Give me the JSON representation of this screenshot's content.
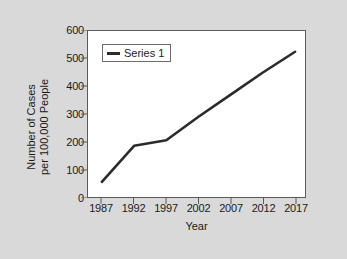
{
  "chart_data": {
    "type": "line",
    "title": "",
    "xlabel": "Year",
    "ylabel": "Number of Cases per 100,000 People",
    "ylabel_lines": [
      "Number of Cases",
      "per 100,000 People"
    ],
    "categories": [
      "1987",
      "1992",
      "1997",
      "2002",
      "2007",
      "2012",
      "2017"
    ],
    "x": [
      1987,
      1992,
      1997,
      2002,
      2007,
      2012,
      2017
    ],
    "series": [
      {
        "name": "Series 1",
        "color": "#2b2b2b",
        "values": [
          55,
          185,
          205,
          290,
          370,
          450,
          525
        ]
      }
    ],
    "ylim": [
      0,
      600
    ],
    "xlim": [
      1987,
      2017
    ],
    "y_ticks": [
      0,
      100,
      200,
      300,
      400,
      500,
      600
    ],
    "y_tick_labels": [
      "0",
      "100",
      "200",
      "300",
      "400",
      "500",
      "600"
    ],
    "x_ticks": [
      1987,
      1992,
      1997,
      2002,
      2007,
      2012,
      2017
    ],
    "x_tick_labels": [
      "1987",
      "1992",
      "1997",
      "2002",
      "2007",
      "2012",
      "2017"
    ],
    "grid": false,
    "legend_position": "top-left",
    "legend_entries": [
      "Series 1"
    ]
  },
  "legend": {
    "series_1_label": "Series 1"
  },
  "axes": {
    "x_title": "Year",
    "y_title_line1": "Number of Cases",
    "y_title_line2": "per 100,000 People"
  },
  "colors": {
    "background": "#d9d9d9",
    "plot_background": "#ffffff",
    "line": "#2b2b2b",
    "axis": "#5a5a5a",
    "text": "#1a1a1a"
  }
}
